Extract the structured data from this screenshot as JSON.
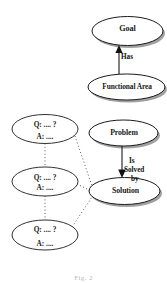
{
  "figure": {
    "caption": "Fig. 2",
    "background_color": "#ffffff",
    "ink_color": "#1a1a1a",
    "shadow_color": "#8d8d8d"
  },
  "nodes": {
    "goal": {
      "label": "Goal",
      "shape": "ellipse",
      "shadow": true
    },
    "functional_area": {
      "label": "Functional Area",
      "shape": "ellipse",
      "shadow": true
    },
    "problem": {
      "label": "Problem",
      "shape": "ellipse",
      "shadow": true
    },
    "solution": {
      "label": "Solution",
      "shape": "ellipse",
      "shadow": true
    },
    "qa1": {
      "question": "Q: .... ?",
      "answer": "A: ....",
      "shape": "ellipse",
      "shadow": false
    },
    "qa2": {
      "question": "Q: .... ?",
      "answer": "A: ....",
      "shape": "ellipse",
      "shadow": false
    },
    "qa3": {
      "question": "Q: .... ?",
      "answer": "A: ....",
      "shape": "ellipse",
      "shadow": false
    }
  },
  "edges": {
    "has": {
      "label": "Has",
      "from": "functional_area",
      "to": "goal",
      "style": "solid",
      "arrow": "up"
    },
    "is_solved_by": {
      "label_line1": "Is",
      "label_line2": "Solved",
      "label_line3": "by",
      "from": "problem",
      "to": "solution",
      "style": "solid",
      "arrow": "down"
    },
    "qa1_qa2": {
      "from": "qa1",
      "to": "qa2",
      "style": "dotted",
      "arrow": "none"
    },
    "qa2_qa3": {
      "from": "qa2",
      "to": "qa3",
      "style": "dotted",
      "arrow": "none"
    },
    "qa1_solution": {
      "from": "qa1",
      "to": "solution",
      "style": "dotted",
      "arrow": "none"
    },
    "qa2_solution": {
      "from": "qa2",
      "to": "solution",
      "style": "dotted",
      "arrow": "none"
    },
    "qa3_solution": {
      "from": "qa3",
      "to": "solution",
      "style": "dotted",
      "arrow": "none"
    }
  }
}
